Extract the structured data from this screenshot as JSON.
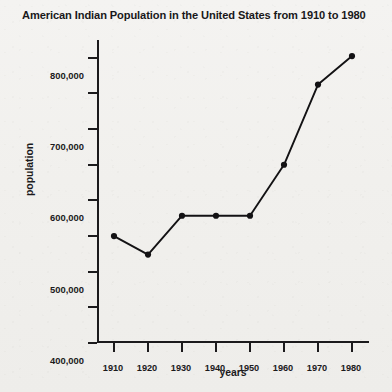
{
  "chart_data": {
    "type": "line",
    "title": "American Indian Population in the United States from 1910 to 1980",
    "xlabel": "years",
    "ylabel": "population",
    "x": [
      1910,
      1920,
      1930,
      1940,
      1950,
      1960,
      1970,
      1980
    ],
    "values": [
      300000,
      248000,
      357000,
      357000,
      357000,
      500000,
      725000,
      805000
    ],
    "xtick_labels": [
      "1910",
      "1920",
      "1930",
      "1940",
      "1950",
      "1960",
      "1970",
      "1980"
    ],
    "ytick_labels": [
      "0",
      "100,000",
      "200,000",
      "300,000",
      "400,000",
      "500,000",
      "600,000",
      "700,000",
      "800,000"
    ],
    "ytick_values": [
      0,
      100000,
      200000,
      300000,
      400000,
      500000,
      600000,
      700000,
      800000
    ],
    "xlim": [
      1905,
      1985
    ],
    "ylim": [
      0,
      850000
    ],
    "grid": false,
    "legend": null,
    "marker": "filled-circle",
    "line_color": "#131214"
  }
}
